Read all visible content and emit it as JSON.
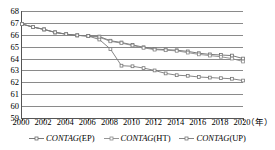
{
  "chart_data": {
    "type": "line",
    "title": "",
    "xlabel": "年",
    "ylabel": "",
    "xlim": [
      2000,
      2020
    ],
    "ylim": [
      59,
      68
    ],
    "grid": true,
    "legend_position": "bottom",
    "x": [
      2000,
      2001,
      2002,
      2003,
      2004,
      2005,
      2006,
      2007,
      2008,
      2009,
      2010,
      2011,
      2012,
      2013,
      2014,
      2015,
      2016,
      2017,
      2018,
      2019,
      2020
    ],
    "xticks": [
      2000,
      2002,
      2004,
      2006,
      2008,
      2010,
      2012,
      2014,
      2016,
      2018,
      2020
    ],
    "yticks": [
      59,
      60,
      61,
      62,
      63,
      64,
      65,
      66,
      67,
      68
    ],
    "series": [
      {
        "name": "CONTAG(EP)",
        "values": [
          66.9,
          66.65,
          66.45,
          66.2,
          66.05,
          65.95,
          65.9,
          65.85,
          65.5,
          65.35,
          65.15,
          64.95,
          64.8,
          64.75,
          64.7,
          64.6,
          64.45,
          64.35,
          64.3,
          64.25,
          64.0
        ]
      },
      {
        "name": "CONTAG(HT)",
        "values": [
          66.9,
          66.65,
          66.45,
          66.2,
          66.05,
          65.95,
          65.9,
          65.8,
          65.45,
          65.3,
          65.1,
          64.9,
          64.75,
          64.7,
          64.65,
          64.5,
          64.35,
          64.25,
          64.15,
          64.0,
          63.75
        ]
      },
      {
        "name": "CONTAG(UP)",
        "values": [
          66.9,
          66.65,
          66.45,
          66.2,
          66.05,
          65.95,
          65.9,
          65.6,
          64.8,
          63.4,
          63.35,
          63.2,
          63.0,
          62.75,
          62.6,
          62.55,
          62.45,
          62.4,
          62.35,
          62.3,
          62.15
        ]
      }
    ]
  },
  "legend": {
    "items": [
      {
        "label_italic": "CONTAG",
        "label_plain": "(EP)"
      },
      {
        "label_italic": "CONTAG",
        "label_plain": "(HT)"
      },
      {
        "label_italic": "CONTAG",
        "label_plain": "(UP)"
      }
    ]
  },
  "colors": {
    "series_ep": "#6b6b6b",
    "series_ht": "#8a8a8a",
    "series_up": "#777777",
    "grid": "#8a8a8a",
    "axis": "#555555",
    "text": "#000000"
  }
}
